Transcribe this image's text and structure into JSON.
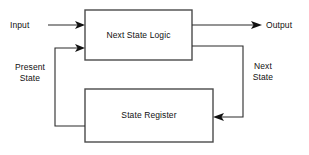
{
  "diagram": {
    "colors": {
      "background": "#ffffff",
      "box_stroke": "#4a4a4a",
      "wire": "#2b2b2b",
      "text": "#111111"
    },
    "blocks": [
      {
        "id": "next-state-logic",
        "label": "Next State Logic"
      },
      {
        "id": "state-register",
        "label": "State Register"
      }
    ],
    "signals": [
      {
        "id": "input",
        "label": "Input"
      },
      {
        "id": "output",
        "label": "Output"
      },
      {
        "id": "present-state",
        "label_line1": "Present",
        "label_line2": "State"
      },
      {
        "id": "next-state",
        "label_line1": "Next",
        "label_line2": "State"
      }
    ]
  }
}
